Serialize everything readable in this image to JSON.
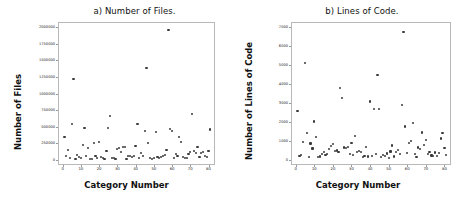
{
  "figure": {
    "width": 467,
    "height": 206,
    "background": "#ffffff",
    "marker_color": "#3a3a3a",
    "frame_color": "#b8b8b8"
  },
  "chart_data": [
    {
      "type": "scatter",
      "panel": "a",
      "title": "a) Number of Files.",
      "xlabel": "Category Number",
      "ylabel": "Number of Files",
      "xlim": [
        -2,
        83
      ],
      "ylim": [
        -60000,
        2060000
      ],
      "grid": false,
      "legend": null,
      "xticks": [
        0,
        10,
        20,
        30,
        40,
        50,
        60,
        70,
        80
      ],
      "xtick_labels": [
        "0",
        "10",
        "20",
        "30",
        "40",
        "50",
        "60",
        "70",
        "80"
      ],
      "yticks": [
        0,
        250000,
        500000,
        750000,
        1000000,
        1250000,
        1500000,
        1750000,
        2000000
      ],
      "ytick_labels": [
        "0",
        "250000",
        "500000",
        "750000",
        "1000000",
        "1250000",
        "1500000",
        "1750000",
        "2000000"
      ],
      "marker": "circle",
      "marker_size": 2.2,
      "x": [
        1,
        2,
        3,
        4,
        5,
        6,
        7,
        8,
        9,
        10,
        11,
        12,
        13,
        14,
        15,
        16,
        17,
        18,
        19,
        20,
        21,
        22,
        23,
        24,
        25,
        26,
        27,
        28,
        29,
        30,
        31,
        32,
        33,
        34,
        35,
        36,
        37,
        38,
        39,
        40,
        41,
        42,
        43,
        44,
        45,
        46,
        47,
        48,
        49,
        50,
        51,
        52,
        53,
        54,
        55,
        56,
        57,
        58,
        59,
        60,
        61,
        62,
        63,
        64,
        65,
        66,
        67,
        68,
        69,
        70,
        71,
        72,
        73,
        74,
        75,
        76,
        77,
        78,
        79,
        80,
        81
      ],
      "y": [
        340000,
        60000,
        145000,
        30000,
        540000,
        1220000,
        20000,
        70000,
        40000,
        25000,
        230000,
        485000,
        55000,
        185000,
        15000,
        20000,
        255000,
        60000,
        35000,
        270000,
        40000,
        25000,
        15000,
        130000,
        480000,
        665000,
        25000,
        30000,
        20000,
        160000,
        185000,
        120000,
        195000,
        200000,
        15000,
        55000,
        65000,
        45000,
        60000,
        210000,
        545000,
        30000,
        100000,
        65000,
        440000,
        1380000,
        255000,
        35000,
        20000,
        30000,
        425000,
        50000,
        25000,
        40000,
        60000,
        70000,
        155000,
        1960000,
        470000,
        435000,
        30000,
        90000,
        65000,
        340000,
        270000,
        45000,
        25000,
        35000,
        90000,
        115000,
        690000,
        130000,
        100000,
        200000,
        45000,
        105000,
        125000,
        60000,
        40000,
        130000,
        460000
      ]
    },
    {
      "type": "scatter",
      "panel": "b",
      "title": "b) Lines of Code.",
      "xlabel": "Category Number",
      "ylabel": "Number of Lines of Code",
      "xlim": [
        -2,
        83
      ],
      "ylim": [
        -210,
        7210
      ],
      "grid": false,
      "legend": null,
      "xticks": [
        0,
        10,
        20,
        30,
        40,
        50,
        60,
        70,
        80
      ],
      "xtick_labels": [
        "0",
        "10",
        "20",
        "30",
        "40",
        "50",
        "60",
        "70",
        "80"
      ],
      "yticks": [
        0,
        1000,
        2000,
        3000,
        4000,
        5000,
        6000,
        7000
      ],
      "ytick_labels": [
        "0",
        "1000",
        "2000",
        "3000",
        "4000",
        "5000",
        "6000",
        "7000"
      ],
      "marker": "circle",
      "marker_size": 2.2,
      "x": [
        1,
        2,
        3,
        4,
        5,
        6,
        7,
        8,
        9,
        10,
        11,
        12,
        13,
        14,
        15,
        16,
        17,
        18,
        19,
        20,
        21,
        22,
        23,
        24,
        25,
        26,
        27,
        28,
        29,
        30,
        31,
        32,
        33,
        34,
        35,
        36,
        37,
        38,
        39,
        40,
        41,
        42,
        43,
        44,
        45,
        46,
        47,
        48,
        49,
        50,
        51,
        52,
        53,
        54,
        55,
        56,
        57,
        58,
        59,
        60,
        61,
        62,
        63,
        64,
        65,
        66,
        67,
        68,
        69,
        70,
        71,
        72,
        73,
        74,
        75,
        76,
        77,
        78,
        79,
        80,
        81
      ],
      "y": [
        2600,
        220,
        260,
        960,
        5100,
        1420,
        160,
        870,
        610,
        2030,
        1200,
        150,
        180,
        330,
        420,
        270,
        300,
        600,
        740,
        860,
        480,
        500,
        420,
        3800,
        3280,
        660,
        620,
        700,
        330,
        900,
        280,
        1280,
        420,
        460,
        440,
        150,
        210,
        700,
        180,
        3080,
        200,
        2680,
        330,
        4480,
        2680,
        150,
        260,
        190,
        340,
        120,
        450,
        760,
        180,
        410,
        520,
        300,
        2900,
        6750,
        1760,
        380,
        880,
        1000,
        1940,
        300,
        160,
        660,
        580,
        1450,
        790,
        1070,
        300,
        440,
        240,
        210,
        400,
        220,
        370,
        1130,
        1400,
        640,
        260
      ]
    }
  ]
}
